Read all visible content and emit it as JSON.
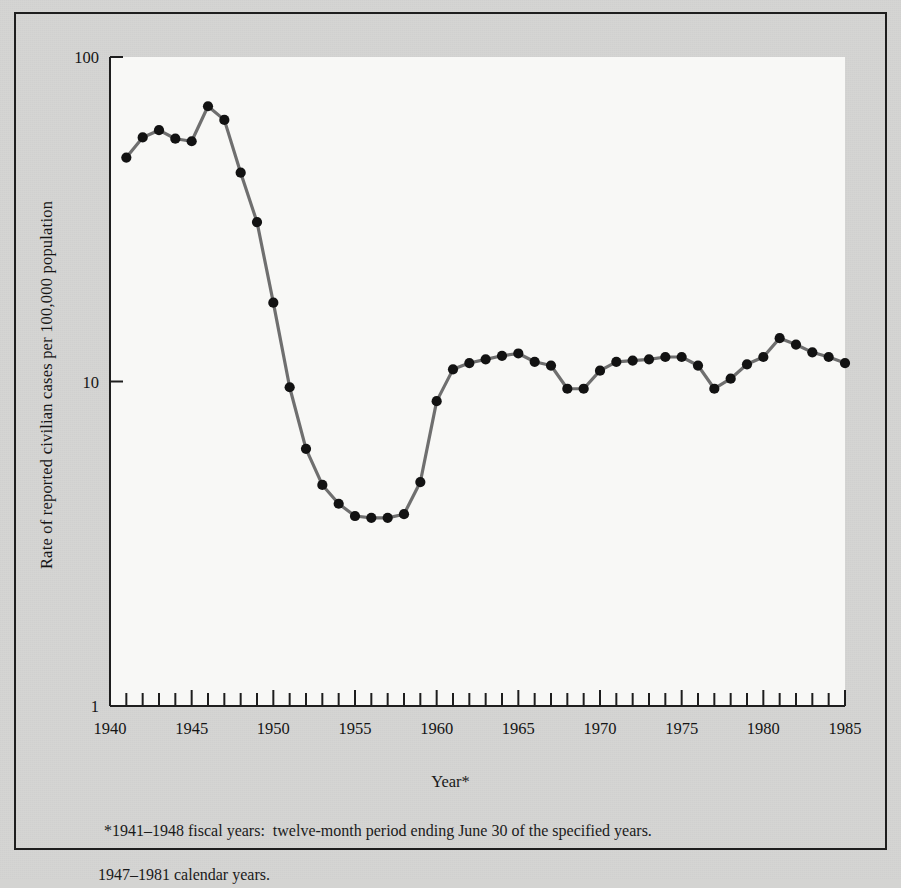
{
  "figure": {
    "ylabel": "Rate of reported civilian cases per 100,000 population",
    "xlabel": "Year*",
    "footnote_line1": "*1941–1948 fiscal years:  twelve-month period ending June 30 of the specified years.",
    "footnote_line2": "1947–1981 calendar years.",
    "frame_color": "#1e1e1e",
    "plot_bg": "#f8f8f6",
    "page_bg": "#d5d5d3",
    "line_color": "#6f6f6f",
    "marker_color": "#121212"
  },
  "chart_data": {
    "type": "line",
    "title": "",
    "subtitle": "",
    "xlabel": "Year*",
    "ylabel": "Rate of reported civilian cases per 100,000 population",
    "yscale": "log",
    "ylim": [
      1,
      100
    ],
    "xlim": [
      1940,
      1985
    ],
    "grid": false,
    "legend": null,
    "ytick_labels": [
      "1",
      "10",
      "100"
    ],
    "ytick_values": [
      1,
      10,
      100
    ],
    "xtick_labels": [
      "1940",
      "1945",
      "1950",
      "1955",
      "1960",
      "1965",
      "1970",
      "1975",
      "1980",
      "1985"
    ],
    "xtick_values": [
      1940,
      1945,
      1950,
      1955,
      1960,
      1965,
      1970,
      1975,
      1980,
      1985
    ],
    "xtick_minor_step": 1,
    "annotations": [
      "*1941–1948 fiscal years:  twelve-month period ending June 30 of the specified years.",
      "1947–1981 calendar years."
    ],
    "x": [
      1941,
      1942,
      1943,
      1944,
      1945,
      1946,
      1947,
      1948,
      1949,
      1950,
      1951,
      1952,
      1953,
      1954,
      1955,
      1956,
      1957,
      1958,
      1959,
      1960,
      1961,
      1962,
      1963,
      1964,
      1965,
      1966,
      1967,
      1968,
      1969,
      1970,
      1971,
      1972,
      1973,
      1974,
      1975,
      1976,
      1977,
      1978,
      1979,
      1980,
      1981,
      1982,
      1983,
      1984,
      1985
    ],
    "values": [
      49.0,
      56.5,
      59.5,
      56.0,
      55.0,
      70.5,
      64.0,
      44.0,
      31.0,
      17.5,
      9.6,
      6.2,
      4.8,
      4.2,
      3.85,
      3.8,
      3.8,
      3.9,
      4.9,
      8.7,
      10.9,
      11.4,
      11.7,
      12.0,
      12.2,
      11.5,
      11.2,
      9.5,
      9.5,
      10.8,
      11.5,
      11.6,
      11.7,
      11.9,
      11.9,
      11.2,
      9.5,
      10.2,
      11.3,
      11.9,
      13.6,
      13.0,
      12.3,
      11.9,
      11.4
    ]
  }
}
